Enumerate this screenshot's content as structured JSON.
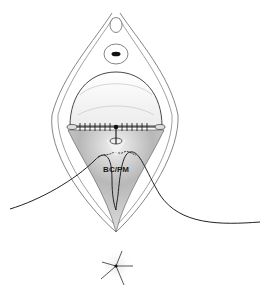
{
  "diagram": {
    "region_label": "BC/PM",
    "colors": {
      "outline": "#555555",
      "suture": "#222222",
      "shade_dark": "#8a8a8a",
      "shade_light": "#f4f4f4",
      "background": "#ffffff"
    }
  }
}
